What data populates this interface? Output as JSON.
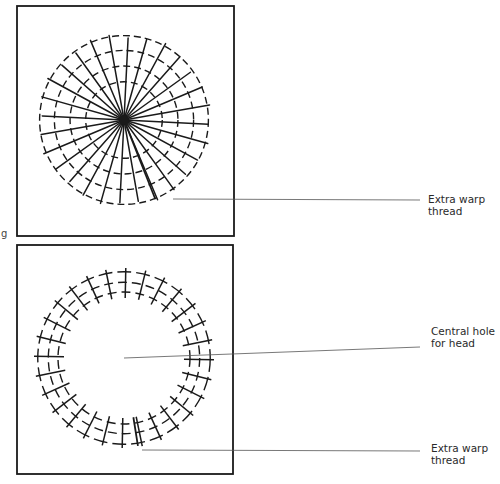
{
  "figure": {
    "top_panel": {
      "name": "warp-circle-full",
      "spoke_count": 28,
      "dashed_rings": 4,
      "center": [
        124,
        120
      ],
      "radius": 87,
      "label": {
        "line1": "Extra warp",
        "line2": "thread"
      }
    },
    "bottom_panel": {
      "name": "warp-ring-with-hole",
      "center": [
        124,
        358
      ],
      "outer_radius": 88,
      "inner_radius": 58,
      "spoke_count": 28,
      "labels": {
        "hole": {
          "line1": "Central hole",
          "line2": "for head"
        },
        "warp": {
          "line1": "Extra warp",
          "line2": "thread"
        }
      }
    },
    "margin_char": "g",
    "colors": {
      "ink": "#1a1a1a",
      "leader": "#555555",
      "text": "#2a2a2a"
    }
  }
}
